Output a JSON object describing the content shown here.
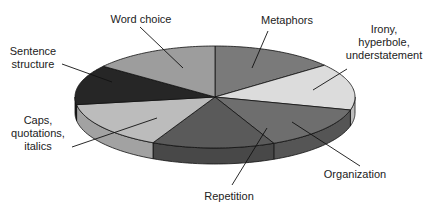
{
  "chart_data": {
    "type": "pie",
    "style": "3d",
    "title": "",
    "slices": [
      {
        "label": "Metaphors",
        "lines": [
          "Metaphors"
        ],
        "value": 14.3,
        "color": "#7a7a7a",
        "side_color": "#5e5e5e"
      },
      {
        "label": "Irony, hyperbole, understatement",
        "lines": [
          "Irony,",
          "hyperbole,",
          "understatement"
        ],
        "value": 14.8,
        "color": "#dcdcdc",
        "side_color": "#bdbdbd"
      },
      {
        "label": "Organization",
        "lines": [
          "Organization"
        ],
        "value": 14.0,
        "color": "#6e6e6e",
        "side_color": "#555555"
      },
      {
        "label": "Repetition",
        "lines": [
          "Repetition"
        ],
        "value": 14.2,
        "color": "#5a5a5a",
        "side_color": "#484848"
      },
      {
        "label": "Caps, quotations, italics",
        "lines": [
          "Caps,",
          "quotations,",
          "italics"
        ],
        "value": 15.3,
        "color": "#bcbcbc",
        "side_color": "#a2a2a2"
      },
      {
        "label": "Sentence structure",
        "lines": [
          "Sentence",
          "structure"
        ],
        "value": 12.7,
        "color": "#262626",
        "side_color": "#1a1a1a"
      },
      {
        "label": "Word choice",
        "lines": [
          "Word choice"
        ],
        "value": 14.7,
        "color": "#9d9d9d",
        "side_color": "#858585"
      }
    ],
    "start_angle_deg": 90,
    "direction": "clockwise",
    "legend": "none (callout labels)"
  }
}
